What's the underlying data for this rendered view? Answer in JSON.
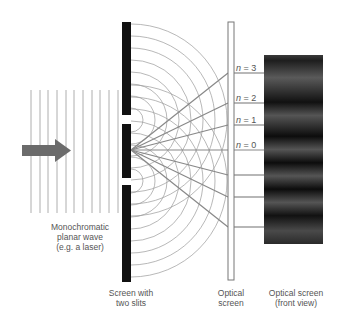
{
  "diagram": {
    "labels": {
      "wave_line1": "Monochromatic",
      "wave_line2": "planar wave",
      "wave_line3": "(e.g. a laser)",
      "slits_line1": "Screen with",
      "slits_line2": "two slits",
      "optical_line1": "Optical",
      "optical_line2": "screen",
      "front_line1": "Optical screen",
      "front_line2": "(front view)"
    },
    "orders": [
      {
        "n": "n",
        "eq": " = 3"
      },
      {
        "n": "n",
        "eq": " = 2"
      },
      {
        "n": "n",
        "eq": " = 1"
      },
      {
        "n": "n",
        "eq": " = 0"
      }
    ],
    "colors": {
      "barrier": "#111111",
      "wave_lines": "#9a9a9a",
      "arrow": "#6b6b6b",
      "rays": "#888888",
      "screen_border": "#777777",
      "pattern_dark": "#1a1a1a",
      "pattern_light": "#555555"
    }
  }
}
